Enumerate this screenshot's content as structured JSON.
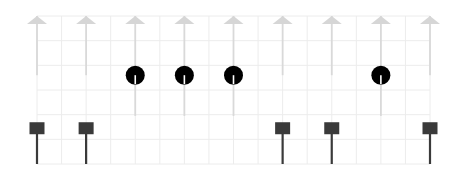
{
  "chart_data": {
    "type": "stem",
    "title": "",
    "xlabel": "",
    "ylabel": "",
    "grid": true,
    "legend": null,
    "x": [
      0,
      1,
      2,
      3,
      4,
      5,
      6,
      7,
      8
    ],
    "xlim": [
      0,
      8
    ],
    "ylim": [
      0,
      6
    ],
    "series": [
      {
        "name": "arrows",
        "marker": "triangle-up",
        "color": "#d6d6d6",
        "stem_color": "#d9d9d9",
        "x": [
          0,
          1,
          2,
          3,
          4,
          5,
          6,
          7,
          8
        ],
        "values": [
          6,
          6,
          6,
          6,
          6,
          6,
          6,
          6,
          6
        ],
        "baseline": 3.6
      },
      {
        "name": "circles",
        "marker": "circle",
        "color": "#000000",
        "stem_color": "#d9d9d9",
        "x": [
          2,
          3,
          4,
          7
        ],
        "values": [
          3.6,
          3.6,
          3.6,
          3.6
        ],
        "baseline": 1.95
      },
      {
        "name": "squares",
        "marker": "square",
        "color": "#3a3a3a",
        "stem_color": "#3a3a3a",
        "x": [
          0,
          1,
          5,
          6,
          8
        ],
        "values": [
          1.45,
          1.45,
          1.45,
          1.45,
          1.45
        ],
        "baseline": 0
      }
    ]
  },
  "layout": {
    "plot_left": 37,
    "plot_right": 430,
    "plot_top": 16,
    "plot_bottom": 164,
    "grid_cols": 16,
    "grid_rows": 6,
    "grid_color": "#ececec"
  }
}
